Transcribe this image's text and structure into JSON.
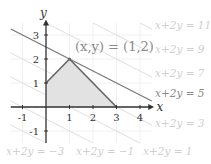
{
  "figure": {
    "width": 211,
    "height": 164,
    "origin_px": [
      46,
      107
    ],
    "unit_px": [
      23.5,
      24
    ],
    "colors": {
      "grid": "#ececec",
      "axis": "#333333",
      "region_fill": "#e2e2e2",
      "region_stroke": "#666666",
      "optimal_line": "#777777",
      "level_line": "#e0e0e0",
      "faint_text": "#cfcfcf",
      "text": "#333333",
      "annotation_text": "#8a8a8a"
    },
    "axes": {
      "x_label": "x",
      "y_label": "y",
      "x_ticks": [
        {
          "value": -1,
          "label": "-1"
        },
        {
          "value": 1,
          "label": "1"
        },
        {
          "value": 2,
          "label": "2"
        },
        {
          "value": 3,
          "label": "3"
        },
        {
          "value": 4,
          "label": "4"
        }
      ],
      "y_ticks": [
        {
          "value": -1,
          "label": "-1"
        },
        {
          "value": 1,
          "label": "1"
        },
        {
          "value": 2,
          "label": "2"
        },
        {
          "value": 3,
          "label": "3"
        }
      ]
    },
    "feasible_region": {
      "vertices": [
        [
          0,
          0
        ],
        [
          0,
          1
        ],
        [
          1,
          2
        ],
        [
          3,
          0
        ]
      ]
    },
    "optimum": {
      "label": "(x,y) = (1,2)",
      "point": [
        1,
        2
      ]
    },
    "level_lines": [
      {
        "c": -3,
        "label": "x+2y = −3",
        "optimal": false
      },
      {
        "c": -1,
        "label": "x+2y = −1",
        "optimal": false
      },
      {
        "c": 1,
        "label": "x+2y = 1",
        "optimal": false
      },
      {
        "c": 3,
        "label": "x+2y = 3",
        "optimal": false
      },
      {
        "c": 5,
        "label": "x+2y = 5",
        "optimal": true
      },
      {
        "c": 7,
        "label": "x+2y = 7",
        "optimal": false
      },
      {
        "c": 9,
        "label": "x+2y = 9",
        "optimal": false
      },
      {
        "c": 11,
        "label": "x+2y = 11",
        "optimal": false
      }
    ]
  }
}
